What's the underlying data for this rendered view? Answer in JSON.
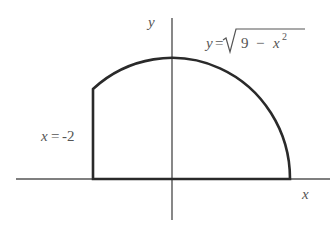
{
  "diagram": {
    "title": "",
    "axes": {
      "x_label": "x",
      "y_label": "y"
    },
    "curve_label": {
      "lhs": "y",
      "eq": "=",
      "radicand_num": "9",
      "radicand_minus": "−",
      "radicand_var": "x",
      "radicand_exp": "2"
    },
    "boundary_label": {
      "lhs": "x",
      "eq": "=",
      "value": "-2"
    },
    "region": {
      "description": "Region bounded by y = sqrt(9 - x^2), x = -2, and the x-axis",
      "x_min": -2,
      "x_max": 3,
      "radius": 3
    },
    "colors": {
      "stroke": "#2a2a2a",
      "axis": "#555555",
      "text": "#555555"
    }
  }
}
